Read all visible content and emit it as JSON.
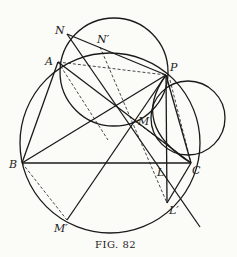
{
  "figure": {
    "caption": "FIG. 82",
    "points": {
      "N": "N",
      "N_prime": "N′",
      "A": "A",
      "P": "P",
      "M": "M",
      "B": "B",
      "L": "L",
      "C": "C",
      "L_prime": "L′",
      "M_prime": "M′"
    }
  }
}
